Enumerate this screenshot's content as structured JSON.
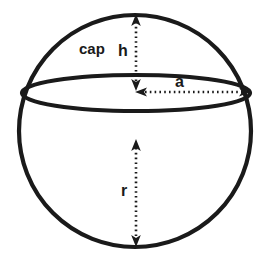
{
  "diagram": {
    "type": "geometry-diagram",
    "background_color": "#ffffff",
    "stroke_color": "#1a1a1a",
    "labels": {
      "cap": "cap",
      "h": "h",
      "a": "a",
      "r": "r"
    },
    "shapes": {
      "sphere": {
        "name": "sphere-outline",
        "cx": 135,
        "cy": 131,
        "r": 116,
        "stroke_width": 4
      },
      "equator_ellipse": {
        "name": "cap-base-ellipse",
        "cx": 136,
        "cy": 93,
        "rx": 114,
        "ry": 18,
        "stroke_width": 4
      }
    },
    "dimensions": [
      {
        "name": "h",
        "label": "h",
        "meaning": "cap height",
        "orientation": "vertical",
        "x1": 136,
        "y1": 16,
        "x2": 136,
        "y2": 90,
        "arrow_start": true,
        "arrow_end": true,
        "style": "dotted"
      },
      {
        "name": "a",
        "label": "a",
        "meaning": "cap base radius",
        "orientation": "horizontal",
        "x1": 138,
        "y1": 92,
        "x2": 250,
        "y2": 92,
        "arrow_start": true,
        "arrow_end": true,
        "style": "dotted"
      },
      {
        "name": "r",
        "label": "r",
        "meaning": "sphere radius",
        "orientation": "vertical",
        "x1": 136,
        "y1": 140,
        "x2": 136,
        "y2": 246,
        "arrow_start": true,
        "arrow_end": true,
        "style": "dotted"
      }
    ]
  }
}
